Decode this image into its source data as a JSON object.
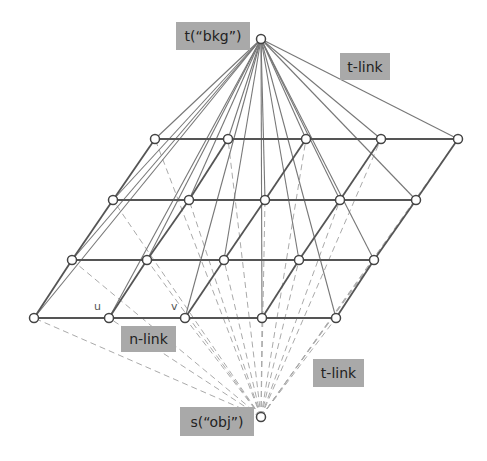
{
  "labels": {
    "terminal_t": "t(“bkg”)",
    "terminal_s": "s(“obj”)",
    "t_link_top": "t-link",
    "t_link_bottom": "t-link",
    "n_link": "n-link",
    "node_u": "u",
    "node_v": "v"
  },
  "terminals": {
    "t": [
      261,
      39
    ],
    "s": [
      261,
      417
    ]
  },
  "grid": [
    [
      [
        155,
        139
      ],
      [
        228,
        139
      ],
      [
        306,
        139
      ],
      [
        381,
        139
      ],
      [
        458,
        139
      ]
    ],
    [
      [
        113,
        200
      ],
      [
        189,
        200
      ],
      [
        265,
        200
      ],
      [
        340,
        200
      ],
      [
        416,
        200
      ]
    ],
    [
      [
        72,
        260
      ],
      [
        147,
        260
      ],
      [
        224,
        260
      ],
      [
        299,
        260
      ],
      [
        374,
        260
      ]
    ],
    [
      [
        34,
        318
      ],
      [
        109,
        318
      ],
      [
        185,
        318
      ],
      [
        262,
        318
      ],
      [
        336,
        318
      ]
    ]
  ],
  "colors": {
    "label_bg": "#a9a9a9",
    "edge": "#555555",
    "t_link": "#777777",
    "s_link": "#aaaaaa"
  }
}
